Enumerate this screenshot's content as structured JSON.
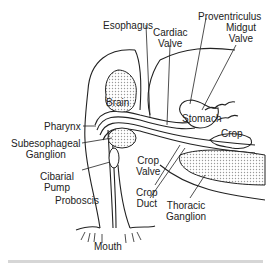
{
  "diagram": {
    "labels": {
      "esophagus": "Esophagus",
      "proventriculus": "Proventriculus",
      "cardiac_valve": "Cardiac\nValve",
      "midgut_valve": "Midgut\nValve",
      "brain": "Brain",
      "pharynx": "Pharynx",
      "stomach": "Stomach",
      "crop": "Crop",
      "subesophageal_ganglion": "Subesophageal\nGanglion",
      "crop_valve": "Crop\nValve",
      "cibarial_pump": "Cibarial\nPump",
      "crop_duct": "Crop\nDuct",
      "thoracic_ganglion": "Thoracic\nGanglion",
      "proboscis": "Proboscis",
      "mouth": "Mouth"
    },
    "colors": {
      "line": "#222222",
      "stipple": "#bdbdbd",
      "background": "#ffffff"
    }
  }
}
